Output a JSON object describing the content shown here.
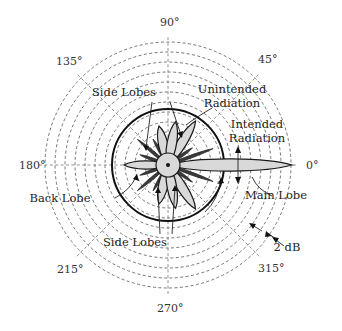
{
  "diagram": {
    "type": "antenna-radiation-pattern-polar",
    "center": [
      168,
      165
    ],
    "ring_spacing_px": 10,
    "ring_count": 11,
    "outer_radius_px": 123,
    "reference_ring_radius_px": 56,
    "angle_labels": [
      {
        "text": "0°",
        "x": 306,
        "y": 169
      },
      {
        "text": "45°",
        "x": 258,
        "y": 63
      },
      {
        "text": "90°",
        "x": 160,
        "y": 26
      },
      {
        "text": "135°",
        "x": 56,
        "y": 65
      },
      {
        "text": "180°",
        "x": 19,
        "y": 169
      },
      {
        "text": "215°",
        "x": 57,
        "y": 273
      },
      {
        "text": "270°",
        "x": 157,
        "y": 312
      },
      {
        "text": "315°",
        "x": 258,
        "y": 272
      }
    ],
    "annotations": [
      {
        "id": "side-lobes-top",
        "lines": [
          "Side Lobes"
        ],
        "x": 124,
        "y": 96
      },
      {
        "id": "unintended-radiation",
        "lines": [
          "Unintended",
          "Radiation"
        ],
        "x": 232,
        "y": 93
      },
      {
        "id": "intended-radiation",
        "lines": [
          "Intended",
          "Radiation"
        ],
        "x": 257,
        "y": 128
      },
      {
        "id": "back-lobe",
        "lines": [
          "Back Lobe"
        ],
        "x": 60,
        "y": 202
      },
      {
        "id": "side-lobes-bottom",
        "lines": [
          "Side Lobes"
        ],
        "x": 135,
        "y": 246
      },
      {
        "id": "main-lobe",
        "lines": [
          "Main Lobe"
        ],
        "x": 276,
        "y": 199
      },
      {
        "id": "scale",
        "lines": [
          "2 dB"
        ],
        "x": 287,
        "y": 251
      }
    ],
    "lobes": {
      "main": {
        "direction_deg": 0,
        "length_px": 124
      },
      "back": {
        "direction_deg": 180,
        "length_px": 44
      },
      "side": [
        {
          "direction_deg": 58,
          "length_px": 52
        },
        {
          "direction_deg": -58,
          "length_px": 52
        },
        {
          "direction_deg": 103,
          "length_px": 40
        },
        {
          "direction_deg": -103,
          "length_px": 40
        },
        {
          "direction_deg": 80,
          "length_px": 44
        },
        {
          "direction_deg": -80,
          "length_px": 44
        }
      ],
      "spikes": [
        {
          "direction_deg": 20,
          "length_px": 48
        },
        {
          "direction_deg": -20,
          "length_px": 48
        },
        {
          "direction_deg": 140,
          "length_px": 40
        },
        {
          "direction_deg": -140,
          "length_px": 40
        },
        {
          "direction_deg": 160,
          "length_px": 30
        },
        {
          "direction_deg": -160,
          "length_px": 30
        },
        {
          "direction_deg": 120,
          "length_px": 30
        },
        {
          "direction_deg": -120,
          "length_px": 30
        },
        {
          "direction_deg": 35,
          "length_px": 30
        },
        {
          "direction_deg": -35,
          "length_px": 30
        }
      ]
    },
    "colors": {
      "lobe_fill": "#d9d9d9",
      "outline": "#1a1a1a",
      "grid": "#666666"
    }
  }
}
